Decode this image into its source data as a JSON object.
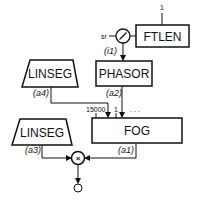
{
  "diagram": {
    "nodes": {
      "ftlen": {
        "label": "FTLEN",
        "input": "1"
      },
      "sr_divider": {
        "input_label": "sr",
        "output_label": "(i1)",
        "symbol": "/"
      },
      "phasor": {
        "label": "PHASOR",
        "output_label": "(a2)"
      },
      "linseg_top": {
        "label": "LINSEG",
        "output_label": "(a4)"
      },
      "fog": {
        "label": "FOG",
        "inputs": [
          "15000",
          "1",
          ". . ."
        ],
        "output_label": "(a1)"
      },
      "linseg_bottom": {
        "label": "LINSEG",
        "output_label": "(a3)"
      },
      "multiplier": {
        "symbol": "×"
      }
    },
    "colors": {
      "stroke": "#111111",
      "background": "#ffffff"
    }
  }
}
